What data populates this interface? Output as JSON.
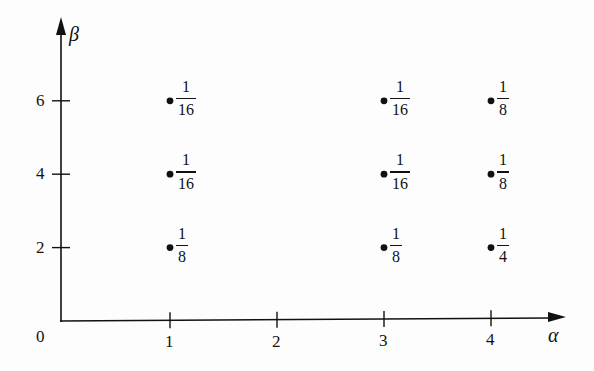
{
  "chart_data": {
    "type": "scatter",
    "title": "",
    "xlabel": "α",
    "ylabel": "β",
    "origin_label": "0",
    "x_ticks": [
      1,
      2,
      3,
      4
    ],
    "y_ticks": [
      2,
      4,
      6
    ],
    "xlim": [
      0,
      4.5
    ],
    "ylim": [
      0,
      7.5
    ],
    "grid": false,
    "points": [
      {
        "x": 1,
        "y": 6,
        "label_num": "1",
        "label_den": "16",
        "value": 0.0625
      },
      {
        "x": 1,
        "y": 4,
        "label_num": "1",
        "label_den": "16",
        "value": 0.0625
      },
      {
        "x": 1,
        "y": 2,
        "label_num": "1",
        "label_den": "8",
        "value": 0.125
      },
      {
        "x": 3,
        "y": 6,
        "label_num": "1",
        "label_den": "16",
        "value": 0.0625
      },
      {
        "x": 3,
        "y": 4,
        "label_num": "1",
        "label_den": "16",
        "value": 0.0625
      },
      {
        "x": 3,
        "y": 2,
        "label_num": "1",
        "label_den": "8",
        "value": 0.125
      },
      {
        "x": 4,
        "y": 6,
        "label_num": "1",
        "label_den": "8",
        "value": 0.125
      },
      {
        "x": 4,
        "y": 4,
        "label_num": "1",
        "label_den": "8",
        "value": 0.125
      },
      {
        "x": 4,
        "y": 2,
        "label_num": "1",
        "label_den": "4",
        "value": 0.25
      }
    ]
  }
}
